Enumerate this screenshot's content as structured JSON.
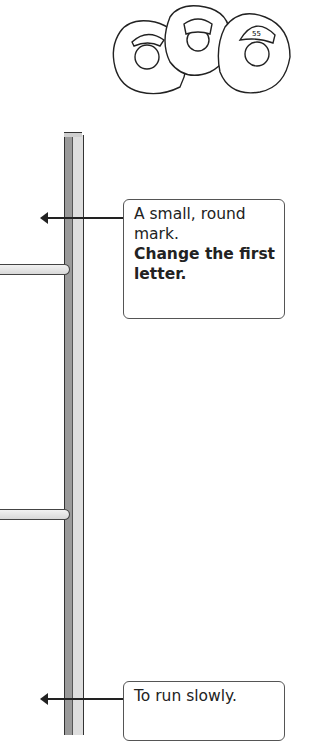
{
  "illustration": {
    "name": "community-helpers",
    "figures": [
      "nurse",
      "chef",
      "firefighter"
    ],
    "helmet_text": "55"
  },
  "clues": [
    {
      "text": "A small, round mark.",
      "instruction": "Change the first letter."
    },
    {
      "text": "To run slowly.",
      "instruction": ""
    }
  ],
  "colors": {
    "pole_dark": "#9a9a9a",
    "pole_light": "#dedede",
    "outline": "#333333"
  }
}
